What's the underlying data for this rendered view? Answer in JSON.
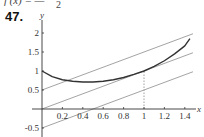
{
  "header": {
    "formula_text": "f′(x) = —",
    "formula_denominator": "2",
    "problem_number": "47."
  },
  "chart_data": {
    "type": "line",
    "title": "",
    "xlabel": "x",
    "ylabel": "y",
    "xlim": [
      0,
      1.5
    ],
    "ylim": [
      -0.5,
      2.2
    ],
    "grid": false,
    "x_ticks": [
      0.2,
      0.4,
      0.6,
      0.8,
      1,
      1.2,
      1.4
    ],
    "x_tick_labels": [
      "0.2",
      "0.4",
      "0.6",
      "0.8",
      "1",
      "1.2",
      "1.4"
    ],
    "y_ticks": [
      -0.5,
      0.5,
      1,
      1.5,
      2
    ],
    "y_tick_labels": [
      "-0.5",
      "0.5",
      "1",
      "1.5",
      "2"
    ],
    "series": [
      {
        "name": "f(x)",
        "color": "#333333",
        "x": [
          0,
          0.1,
          0.2,
          0.3,
          0.4,
          0.5,
          0.6,
          0.7,
          0.8,
          0.9,
          1.0,
          1.1,
          1.2,
          1.3,
          1.4,
          1.45
        ],
        "y": [
          1.0,
          0.85,
          0.77,
          0.73,
          0.71,
          0.71,
          0.73,
          0.77,
          0.83,
          0.91,
          1.0,
          1.12,
          1.27,
          1.45,
          1.66,
          1.85
        ]
      },
      {
        "name": "y = x + 0.5",
        "color": "#999999",
        "x": [
          0,
          1.48
        ],
        "y": [
          0.5,
          1.98
        ]
      },
      {
        "name": "y = x",
        "color": "#999999",
        "x": [
          0,
          1.48
        ],
        "y": [
          0,
          1.48
        ]
      },
      {
        "name": "y = x - 0.5",
        "color": "#999999",
        "x": [
          0,
          1.48
        ],
        "y": [
          -0.5,
          0.98
        ]
      }
    ],
    "annotations": [
      {
        "type": "dashed-vertical",
        "x": 1,
        "from_y": 0,
        "to_y": 1
      }
    ]
  }
}
